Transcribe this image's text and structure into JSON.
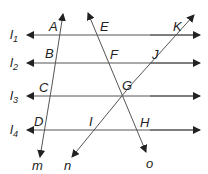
{
  "diagram": {
    "type": "geometry-parallel-lines-transversals",
    "parallel_lines": [
      {
        "name": "l",
        "sub": "1"
      },
      {
        "name": "l",
        "sub": "2"
      },
      {
        "name": "l",
        "sub": "3"
      },
      {
        "name": "l",
        "sub": "4"
      }
    ],
    "transversals": [
      {
        "name": "m"
      },
      {
        "name": "n"
      },
      {
        "name": "o"
      }
    ],
    "points": [
      "A",
      "B",
      "C",
      "D",
      "E",
      "F",
      "G",
      "H",
      "I",
      "J",
      "K"
    ],
    "colors": {
      "line": "#555555",
      "text": "#222222",
      "background": "#ffffff"
    }
  }
}
